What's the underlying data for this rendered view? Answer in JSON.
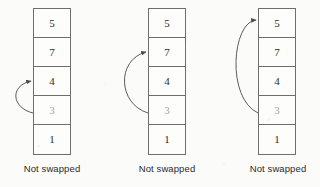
{
  "figure": {
    "type": "bubble-sort-pass-diagram",
    "background_color": "#fbfbfa",
    "box_border_color": "#6e6e6e",
    "value_color": "#2b2b2b",
    "dim_value_color": "#a4a4a4",
    "arrow_color": "#4a4a4a"
  },
  "stages": [
    {
      "id": "stage-1",
      "caption": "Not swapped",
      "cells": [
        {
          "value": "5",
          "dim": false
        },
        {
          "value": "7",
          "dim": false
        },
        {
          "value": "4",
          "dim": false
        },
        {
          "value": "3",
          "dim": true
        },
        {
          "value": "1",
          "dim": false
        }
      ],
      "arrow": {
        "from_index": 3,
        "to_index": 2,
        "from_value": "3",
        "to_value": "4"
      }
    },
    {
      "id": "stage-2",
      "caption": "Not swapped",
      "cells": [
        {
          "value": "5",
          "dim": false
        },
        {
          "value": "7",
          "dim": false
        },
        {
          "value": "4",
          "dim": false
        },
        {
          "value": "3",
          "dim": true
        },
        {
          "value": "1",
          "dim": false
        }
      ],
      "arrow": {
        "from_index": 3,
        "to_index": 1,
        "from_value": "3",
        "to_value": "7"
      }
    },
    {
      "id": "stage-3",
      "caption": "Not swapped",
      "cells": [
        {
          "value": "5",
          "dim": false
        },
        {
          "value": "7",
          "dim": false
        },
        {
          "value": "4",
          "dim": false
        },
        {
          "value": "3",
          "dim": true
        },
        {
          "value": "1",
          "dim": false
        }
      ],
      "arrow": {
        "from_index": 3,
        "to_index": 0,
        "from_value": "3",
        "to_value": "5"
      }
    }
  ]
}
